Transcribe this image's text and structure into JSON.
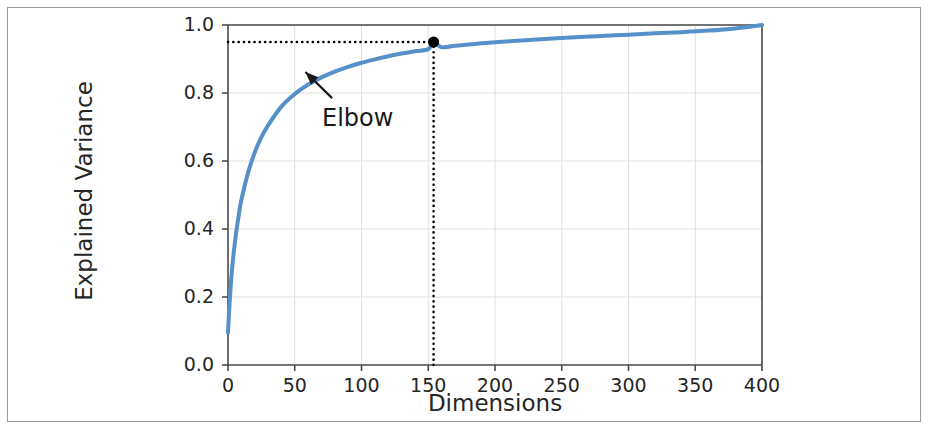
{
  "figure": {
    "background_color": "#ffffff",
    "border_color": "#9a9a9a"
  },
  "chart_data": {
    "type": "line",
    "title": "",
    "subtitle": "",
    "xlabel": "Dimensions",
    "ylabel": "Explained Variance",
    "xlim": [
      0,
      400
    ],
    "ylim": [
      0.0,
      1.0
    ],
    "xticks": [
      0,
      50,
      100,
      150,
      200,
      250,
      300,
      350,
      400
    ],
    "xtick_labels": [
      "0",
      "50",
      "100",
      "150",
      "200",
      "250",
      "300",
      "350",
      "400"
    ],
    "yticks": [
      0.0,
      0.2,
      0.4,
      0.6,
      0.8,
      1.0
    ],
    "ytick_labels": [
      "0.0",
      "0.2",
      "0.4",
      "0.6",
      "0.8",
      "1.0"
    ],
    "grid": true,
    "grid_color": "#dedede",
    "legend": null,
    "legend_position": "none",
    "series": [
      {
        "name": "Cumulative explained variance",
        "color": "#5590c8",
        "line_width": 4,
        "x": [
          0,
          1,
          2,
          3,
          5,
          8,
          10,
          15,
          20,
          25,
          30,
          40,
          50,
          60,
          70,
          80,
          90,
          100,
          110,
          120,
          130,
          140,
          150,
          154,
          160,
          170,
          180,
          190,
          200,
          220,
          240,
          260,
          280,
          300,
          320,
          340,
          360,
          380,
          400
        ],
        "y": [
          0.095,
          0.17,
          0.23,
          0.28,
          0.355,
          0.44,
          0.485,
          0.565,
          0.625,
          0.67,
          0.705,
          0.76,
          0.797,
          0.825,
          0.846,
          0.863,
          0.877,
          0.889,
          0.899,
          0.908,
          0.916,
          0.923,
          0.929,
          0.95,
          0.9345,
          0.939,
          0.9425,
          0.946,
          0.949,
          0.9545,
          0.9595,
          0.964,
          0.968,
          0.9715,
          0.9755,
          0.979,
          0.9835,
          0.99,
          1.0
        ]
      }
    ],
    "markers": [
      {
        "name": "elbow-point",
        "x": 154,
        "y": 0.95,
        "color": "#000000",
        "size": 11
      }
    ],
    "reference_lines": [
      {
        "name": "horizontal-threshold",
        "orientation": "horizontal",
        "value": 0.95,
        "style": "dotted",
        "color": "#000000",
        "from": 0,
        "to": 154
      },
      {
        "name": "vertical-threshold",
        "orientation": "vertical",
        "value": 154,
        "style": "dotted",
        "color": "#000000",
        "from": 0.0,
        "to": 0.95
      }
    ],
    "annotations": [
      {
        "name": "elbow",
        "text": "Elbow",
        "text_x": 73,
        "text_y": 0.735,
        "arrow_from_x": 78,
        "arrow_from_y": 0.785,
        "arrow_to_x": 58,
        "arrow_to_y": 0.862,
        "color": "#1a1a1a"
      }
    ]
  },
  "axis_labels": {
    "x_title": "Dimensions",
    "y_title": "Explained Variance"
  },
  "annotation_text": {
    "elbow": "Elbow"
  }
}
